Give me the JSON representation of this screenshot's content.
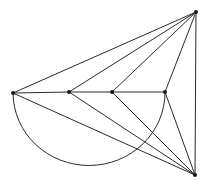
{
  "diagram": {
    "type": "graph",
    "stroke_color": "#2a2a2a",
    "node_color": "#1a1a1a",
    "background": "#ffffff",
    "nodes": [
      {
        "id": "A",
        "x": 13,
        "y": 93
      },
      {
        "id": "B",
        "x": 69,
        "y": 92
      },
      {
        "id": "C",
        "x": 112,
        "y": 92
      },
      {
        "id": "D",
        "x": 165,
        "y": 92
      },
      {
        "id": "T",
        "x": 196,
        "y": 12
      },
      {
        "id": "S",
        "x": 195,
        "y": 175
      }
    ],
    "edges": [
      {
        "from": "A",
        "to": "B",
        "kind": "line"
      },
      {
        "from": "B",
        "to": "C",
        "kind": "line"
      },
      {
        "from": "C",
        "to": "D",
        "kind": "line"
      },
      {
        "from": "T",
        "to": "A",
        "kind": "line"
      },
      {
        "from": "T",
        "to": "B",
        "kind": "line"
      },
      {
        "from": "T",
        "to": "C",
        "kind": "line"
      },
      {
        "from": "T",
        "to": "D",
        "kind": "line"
      },
      {
        "from": "T",
        "to": "S",
        "kind": "line"
      },
      {
        "from": "S",
        "to": "A",
        "kind": "line"
      },
      {
        "from": "S",
        "to": "B",
        "kind": "line"
      },
      {
        "from": "S",
        "to": "C",
        "kind": "line"
      },
      {
        "from": "S",
        "to": "D",
        "kind": "line"
      },
      {
        "from": "A",
        "to": "D",
        "kind": "arc",
        "rx": 76,
        "ry": 73,
        "below": true
      }
    ]
  }
}
